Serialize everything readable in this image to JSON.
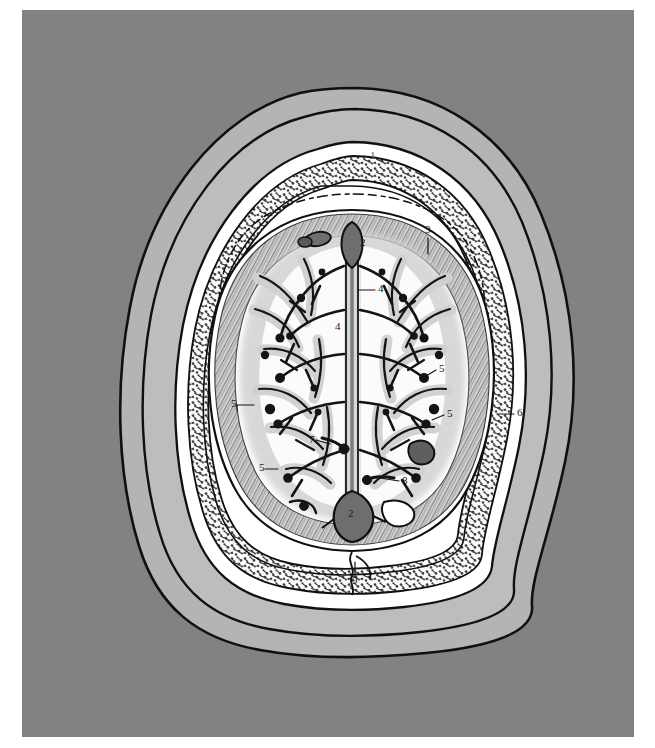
{
  "figure": {
    "type": "anatomical-illustration",
    "view": "axial-cross-section",
    "orientation": "anterior at top, posterior at bottom",
    "style": "line drawing with halftone gray shading",
    "background_color": "#828282",
    "page_color": "#ffffff"
  },
  "palette": {
    "plate_background": "#828282",
    "scalp_outer": "#b4b4b4",
    "scalp_inner": "#bdbdbd",
    "skull_table": "#ffffff",
    "diploe_fill": "#f2f2f2",
    "diploe_stipple": "#4a4a4a",
    "subarachnoid_space": "#ffffff",
    "dura_hatch": "#8c8c8c",
    "cortex_gray_matter": "#d9d9d9",
    "white_matter": "#fbfbfb",
    "vessel_ink": "#141414",
    "sinus_fill": "#6e6e6e",
    "outline_ink": "#101010"
  },
  "labels": [
    {
      "id": "l1",
      "text": "1",
      "x": 348,
      "y": 146,
      "faint": true,
      "refers_to": "scalp",
      "leader": "none"
    },
    {
      "id": "l2a",
      "text": "2",
      "x": 338,
      "y": 233,
      "faint": false,
      "refers_to": "superior sagittal sinus (anterior)",
      "leader": "none"
    },
    {
      "id": "l3",
      "text": "3",
      "x": 404,
      "y": 220,
      "faint": false,
      "refers_to": "diploe / cranial vault bone",
      "leader": "down"
    },
    {
      "id": "l4a",
      "text": "4",
      "x": 356,
      "y": 279,
      "faint": false,
      "refers_to": "falx cerebri",
      "leader": "left"
    },
    {
      "id": "l4b",
      "text": "4",
      "x": 314,
      "y": 317,
      "faint": false,
      "refers_to": "falx cerebri",
      "leader": "none"
    },
    {
      "id": "l5a",
      "text": "5",
      "x": 417,
      "y": 359,
      "faint": false,
      "refers_to": "cerebral vein / sulcus",
      "leader": "right"
    },
    {
      "id": "l5b",
      "text": "5",
      "x": 212,
      "y": 394,
      "faint": false,
      "refers_to": "cerebral vein / sulcus",
      "leader": "left"
    },
    {
      "id": "l5c",
      "text": "5",
      "x": 425,
      "y": 404,
      "faint": false,
      "refers_to": "cerebral vein / sulcus",
      "leader": "right"
    },
    {
      "id": "l5d",
      "text": "5",
      "x": 240,
      "y": 458,
      "faint": false,
      "refers_to": "cerebral vein / sulcus",
      "leader": "left"
    },
    {
      "id": "l6",
      "text": "6",
      "x": 496,
      "y": 403,
      "faint": false,
      "refers_to": "cranial vault / scalp layer",
      "leader": "left"
    },
    {
      "id": "l7",
      "text": "7",
      "x": 290,
      "y": 430,
      "faint": false,
      "refers_to": "cortical vessel",
      "leader": "right"
    },
    {
      "id": "l8",
      "text": "8",
      "x": 380,
      "y": 471,
      "faint": false,
      "refers_to": "cortical vessel",
      "leader": "left"
    },
    {
      "id": "l2b",
      "text": "2",
      "x": 329,
      "y": 500,
      "faint": false,
      "refers_to": "superior sagittal sinus (posterior)",
      "leader": "none"
    },
    {
      "id": "l9",
      "text": "9",
      "x": 333,
      "y": 569,
      "faint": false,
      "refers_to": "occipital diploe / suture",
      "leader": "up"
    }
  ],
  "structures": [
    {
      "key": "scalp",
      "number": "1",
      "name": "Scalp"
    },
    {
      "key": "sss",
      "number": "2",
      "name": "Superior sagittal sinus"
    },
    {
      "key": "diploe",
      "number": "3",
      "name": "Diploe of cranial vault"
    },
    {
      "key": "falx",
      "number": "4",
      "name": "Falx cerebri"
    },
    {
      "key": "veins",
      "number": "5",
      "name": "Superior cerebral veins"
    },
    {
      "key": "vault",
      "number": "6",
      "name": "Cranial vault"
    },
    {
      "key": "vessel7",
      "number": "7",
      "name": "Cortical vessel"
    },
    {
      "key": "vessel8",
      "number": "8",
      "name": "Cortical vessel"
    },
    {
      "key": "occipital",
      "number": "9",
      "name": "Occipital bone"
    }
  ]
}
